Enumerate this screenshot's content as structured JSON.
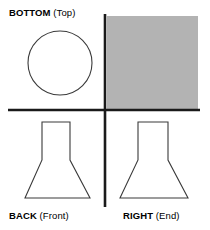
{
  "diagram": {
    "type": "orthographic-projection",
    "title_visible": false,
    "background_color": "#ffffff",
    "line_color": "#3a3a3a",
    "axis_color": "#1a1a1a",
    "shaded_fill_color": "#b3b3b3",
    "quadrants": {
      "top_left": {
        "label_primary": "BOTTOM",
        "label_paren": " (Top)",
        "shape": "circle"
      },
      "top_right": {
        "label_primary": "",
        "label_paren": "",
        "shape": "filled-rectangle"
      },
      "bottom_left": {
        "label_primary": "BACK",
        "label_paren": " (Front)",
        "shape": "flange-profile"
      },
      "bottom_right": {
        "label_primary": "RIGHT",
        "label_paren": " (End)",
        "shape": "flange-profile"
      }
    },
    "geometry": {
      "axis_vertical_x": 105,
      "axis_horizontal_y": 110,
      "axis_vertical_top": 14,
      "axis_vertical_bottom": 207,
      "axis_horizontal_left": 8,
      "axis_horizontal_right": 200,
      "axis_stroke_width": 2.6,
      "circle_cx": 60,
      "circle_cy": 63,
      "circle_r": 32,
      "gray_rect_x": 107,
      "gray_rect_y": 16,
      "gray_rect_w": 91,
      "gray_rect_h": 93,
      "flange_left_points": "42,122 70,122 70,160 90,198 25,198 42,160",
      "flange_right_points": "138,122 168,122 168,160 188,198 120,198 138,160",
      "outline_stroke_width": 1.1
    }
  }
}
